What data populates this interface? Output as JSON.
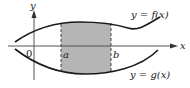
{
  "diagram": {
    "axes": {
      "x_label": "x",
      "y_label": "y",
      "origin_label": "0"
    },
    "bounds": {
      "a_label": "a",
      "b_label": "b"
    },
    "curves": {
      "f_label": "y = f(x)",
      "g_label": "y = g(x)"
    },
    "colors": {
      "shade": "#b5b5b5",
      "stroke": "#1a1a1a",
      "axis": "#555555"
    }
  }
}
